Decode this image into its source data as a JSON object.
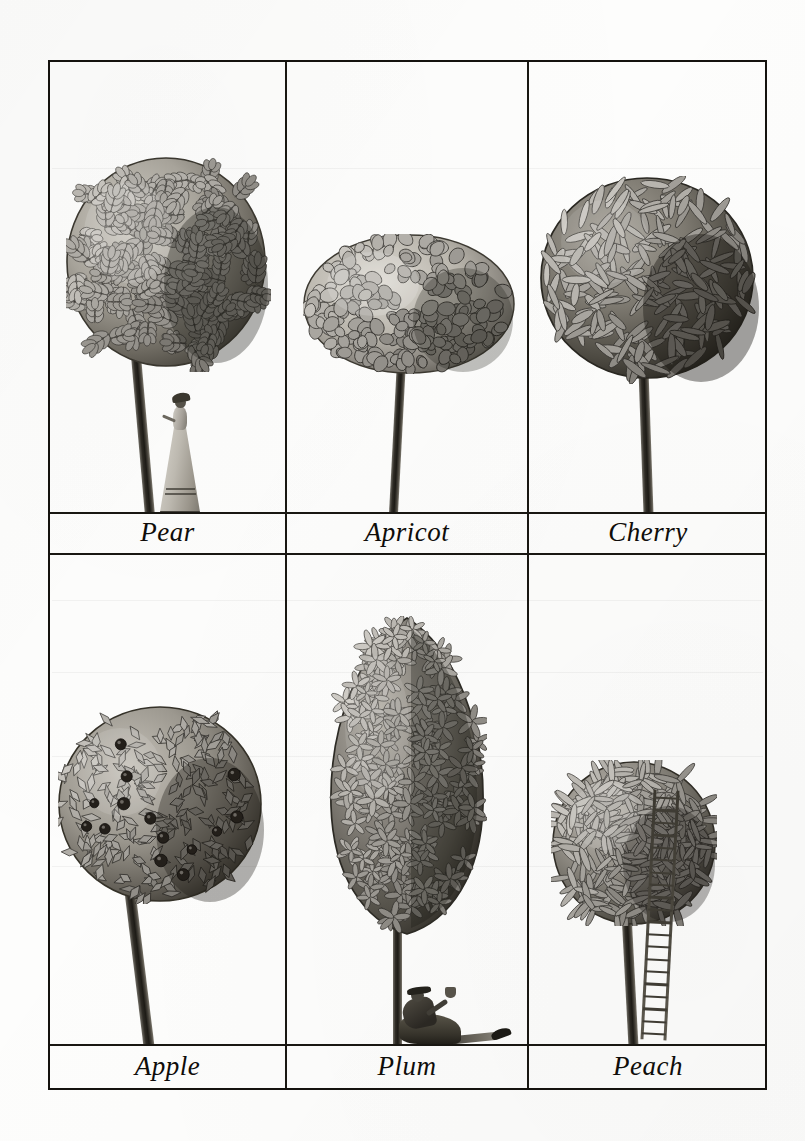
{
  "plate": {
    "title": "Fruit Trees Plate",
    "paper_color": "#fdfdfc",
    "ink_color": "#191712",
    "frame": {
      "x": 48,
      "y": 60,
      "width": 719,
      "height": 1030,
      "border_color": "#15130f"
    },
    "grid": {
      "columns": 3,
      "rows": 2,
      "column_dividers_x": [
        285,
        527
      ],
      "row_divider_y": 553
    },
    "medium": "graphite pencil drawing, grayscale"
  },
  "cells": [
    {
      "id": "pear",
      "label": "Pear",
      "row": 1,
      "column": 1,
      "crown_shape": "round",
      "crown_tone": "mid-gray, light on left, dark on right",
      "leaf_style": "compound pinnate sprays",
      "has_figure": true,
      "figure": "woman-in-long-gown",
      "has_fruit": false,
      "has_ladder": false
    },
    {
      "id": "apricot",
      "label": "Apricot",
      "row": 1,
      "column": 2,
      "crown_shape": "wide flattened oval",
      "crown_tone": "light gray with dark outlines",
      "leaf_style": "rounded heart-shaped leaves",
      "has_figure": false,
      "figure": "",
      "has_fruit": false,
      "has_ladder": false
    },
    {
      "id": "cherry",
      "label": "Cherry",
      "row": 1,
      "column": 3,
      "crown_shape": "broad round",
      "crown_tone": "dark gray, heavy shadow lower right",
      "leaf_style": "long lance-shaped leaves",
      "has_figure": false,
      "figure": "",
      "has_fruit": false,
      "has_ladder": false
    },
    {
      "id": "apple",
      "label": "Apple",
      "row": 2,
      "column": 1,
      "crown_shape": "round, slightly tilted",
      "crown_tone": "mid-gray with dark right edge",
      "leaf_style": "pointed leaves in herringbone sprays",
      "has_figure": false,
      "figure": "",
      "has_fruit": true,
      "fruit_count": 14,
      "has_ladder": false
    },
    {
      "id": "plum",
      "label": "Plum",
      "row": 2,
      "column": 2,
      "crown_shape": "tall narrow pointed oval",
      "crown_tone": "dark gray, dense",
      "leaf_style": "star-shaped leaf clusters",
      "has_figure": true,
      "figure": "man-reclining-raising-cup",
      "has_fruit": false,
      "has_ladder": false
    },
    {
      "id": "peach",
      "label": "Peach",
      "row": 2,
      "column": 3,
      "crown_shape": "round bushy",
      "crown_tone": "mid-to-dark gray",
      "leaf_style": "narrow pointed leaves in whorls",
      "has_figure": false,
      "figure": "",
      "has_fruit": false,
      "has_ladder": true,
      "ladder_rungs": 20
    }
  ]
}
